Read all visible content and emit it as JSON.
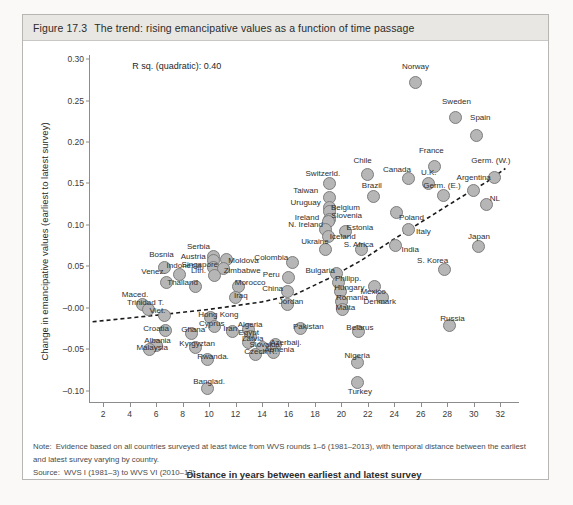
{
  "figure": {
    "number": "Figure 17.3",
    "caption": "The trend: rising emancipative values as a function of time passage"
  },
  "notes": {
    "note_lead": "Note:",
    "note_text": "Evidence based on all countries surveyed at least twice from WVS rounds 1–6 (1981–2013), with temporal distance between the earliest and latest survey varying by country.",
    "source_lead": "Source:",
    "source_text": "WVS I (1981–3) to WVS VI (2010–13)."
  },
  "annotation": {
    "r_squared": "R sq. (quadratic): 0.40"
  },
  "colors": {
    "marker_fill": "#b6b6b6",
    "marker_stroke": "#7d7d7d",
    "trend_line": "#1a1a1a",
    "axis": "#8c8c8c",
    "caption_bg": "#e8e7e4",
    "panel_bg": "#ffffff"
  },
  "chart_data": {
    "type": "scatter",
    "title": "The trend: rising emancipative values as a function of time passage",
    "xlabel": "Distance in years between earliest and latest survey",
    "ylabel": "Change in emancipative values (earliest to latest survey)",
    "xlim": [
      1,
      33.5
    ],
    "ylim": [
      -0.115,
      0.305
    ],
    "xticks": [
      2,
      4,
      6,
      8,
      10,
      12,
      14,
      16,
      18,
      20,
      22,
      24,
      26,
      28,
      30,
      32
    ],
    "ytick_labels": [
      "0.30",
      "0.25",
      "0.20",
      "0.15",
      "0.10",
      "0.05",
      "–0.00",
      "–0.05",
      "–0.10"
    ],
    "yticks": [
      0.3,
      0.25,
      0.2,
      0.15,
      0.1,
      0.05,
      0.0,
      -0.05,
      -0.1
    ],
    "grid": false,
    "legend": "none",
    "r_squared_quadratic": 0.4,
    "trend_type": "quadratic (dashed)",
    "trend_points": [
      {
        "x": 1.2,
        "y": -0.017
      },
      {
        "x": 6.0,
        "y": -0.009
      },
      {
        "x": 10.0,
        "y": -0.002
      },
      {
        "x": 14.0,
        "y": 0.007
      },
      {
        "x": 16.5,
        "y": 0.016
      },
      {
        "x": 19.0,
        "y": 0.035
      },
      {
        "x": 21.5,
        "y": 0.057
      },
      {
        "x": 24.0,
        "y": 0.083
      },
      {
        "x": 26.5,
        "y": 0.108
      },
      {
        "x": 29.0,
        "y": 0.133
      },
      {
        "x": 31.0,
        "y": 0.152
      },
      {
        "x": 32.4,
        "y": 0.168
      }
    ],
    "points": [
      {
        "label": "Norway",
        "x": 25.6,
        "y": 0.272,
        "lx": 25.6,
        "ly": 0.292
      },
      {
        "label": "Sweden",
        "x": 28.6,
        "y": 0.229,
        "lx": 28.7,
        "ly": 0.25
      },
      {
        "label": "Spain",
        "x": 30.2,
        "y": 0.208,
        "lx": 30.5,
        "ly": 0.23
      },
      {
        "label": "France",
        "x": 27.0,
        "y": 0.17,
        "lx": 26.8,
        "ly": 0.19
      },
      {
        "label": "Germ. (W.)",
        "x": 31.6,
        "y": 0.157,
        "lx": 31.3,
        "ly": 0.178
      },
      {
        "label": "Canada",
        "x": 25.1,
        "y": 0.156,
        "lx": 24.2,
        "ly": 0.168
      },
      {
        "label": "U.K.",
        "x": 26.6,
        "y": 0.15,
        "lx": 26.6,
        "ly": 0.164
      },
      {
        "label": "Argentina",
        "x": 30.0,
        "y": 0.141,
        "lx": 30.0,
        "ly": 0.158
      },
      {
        "label": "Germ. (E.)",
        "x": 27.7,
        "y": 0.135,
        "lx": 27.6,
        "ly": 0.148
      },
      {
        "label": "NL",
        "x": 31.0,
        "y": 0.124,
        "lx": 31.6,
        "ly": 0.132
      },
      {
        "label": "Chile",
        "x": 22.0,
        "y": 0.161,
        "lx": 21.6,
        "ly": 0.178
      },
      {
        "label": "Switzerld.",
        "x": 19.1,
        "y": 0.15,
        "lx": 18.6,
        "ly": 0.163
      },
      {
        "label": "Taiwan",
        "x": 19.1,
        "y": 0.133,
        "lx": 17.3,
        "ly": 0.142
      },
      {
        "label": "Brazil",
        "x": 22.4,
        "y": 0.134,
        "lx": 22.3,
        "ly": 0.148
      },
      {
        "label": "Uruguay",
        "x": 19.1,
        "y": 0.121,
        "lx": 17.3,
        "ly": 0.127
      },
      {
        "label": "Belgium",
        "x": 19.1,
        "y": 0.116,
        "lx": 20.3,
        "ly": 0.122
      },
      {
        "label": "Slovenia",
        "x": 19.1,
        "y": 0.107,
        "lx": 20.4,
        "ly": 0.112
      },
      {
        "label": "Ireland",
        "x": 19.0,
        "y": 0.104,
        "lx": 17.4,
        "ly": 0.11
      },
      {
        "label": "Poland",
        "x": 24.2,
        "y": 0.115,
        "lx": 25.3,
        "ly": 0.11
      },
      {
        "label": "N. Ireland",
        "x": 18.8,
        "y": 0.095,
        "lx": 17.3,
        "ly": 0.101
      },
      {
        "label": "Estonia",
        "x": 20.3,
        "y": 0.092,
        "lx": 21.4,
        "ly": 0.098
      },
      {
        "label": "Italy",
        "x": 25.1,
        "y": 0.095,
        "lx": 26.2,
        "ly": 0.092
      },
      {
        "label": "Iceland",
        "x": 19.0,
        "y": 0.086,
        "lx": 20.1,
        "ly": 0.086
      },
      {
        "label": "Japan",
        "x": 30.4,
        "y": 0.074,
        "lx": 30.4,
        "ly": 0.087
      },
      {
        "label": "S. Africa",
        "x": 21.5,
        "y": 0.07,
        "lx": 21.3,
        "ly": 0.077
      },
      {
        "label": "India",
        "x": 24.1,
        "y": 0.075,
        "lx": 25.2,
        "ly": 0.071
      },
      {
        "label": "Ukraine",
        "x": 18.8,
        "y": 0.07,
        "lx": 18.0,
        "ly": 0.08
      },
      {
        "label": "Serbia",
        "x": 10.3,
        "y": 0.062,
        "lx": 9.2,
        "ly": 0.074
      },
      {
        "label": "Bosnia",
        "x": 6.6,
        "y": 0.048,
        "lx": 6.4,
        "ly": 0.065
      },
      {
        "label": "Austria",
        "x": 10.3,
        "y": 0.057,
        "lx": 8.8,
        "ly": 0.062
      },
      {
        "label": "Moldova",
        "x": 11.3,
        "y": 0.058,
        "lx": 12.6,
        "ly": 0.057
      },
      {
        "label": "Singapore",
        "x": 10.3,
        "y": 0.048,
        "lx": 9.3,
        "ly": 0.053
      },
      {
        "label": "Indonesia",
        "x": 7.8,
        "y": 0.04,
        "lx": 8.1,
        "ly": 0.051
      },
      {
        "label": "Zimbabwe",
        "x": 11.1,
        "y": 0.047,
        "lx": 12.5,
        "ly": 0.046
      },
      {
        "label": "Lith.",
        "x": 10.4,
        "y": 0.039,
        "lx": 9.2,
        "ly": 0.045
      },
      {
        "label": "Colombia",
        "x": 16.3,
        "y": 0.054,
        "lx": 14.7,
        "ly": 0.061
      },
      {
        "label": "Venez.",
        "x": 6.8,
        "y": 0.031,
        "lx": 5.8,
        "ly": 0.044
      },
      {
        "label": "S. Korea",
        "x": 27.8,
        "y": 0.046,
        "lx": 26.9,
        "ly": 0.058
      },
      {
        "label": "Bulgaria",
        "x": 19.6,
        "y": 0.041,
        "lx": 18.4,
        "ly": 0.046
      },
      {
        "label": "Peru",
        "x": 16.0,
        "y": 0.036,
        "lx": 14.7,
        "ly": 0.041
      },
      {
        "label": "Thailand",
        "x": 9.0,
        "y": 0.026,
        "lx": 8.0,
        "ly": 0.031
      },
      {
        "label": "Morocco",
        "x": 12.2,
        "y": 0.026,
        "lx": 13.1,
        "ly": 0.031
      },
      {
        "label": "Philipp.",
        "x": 19.8,
        "y": 0.03,
        "lx": 20.5,
        "ly": 0.036
      },
      {
        "label": "Mexico",
        "x": 22.5,
        "y": 0.026,
        "lx": 22.4,
        "ly": 0.02
      },
      {
        "label": "Hungary",
        "x": 19.9,
        "y": 0.019,
        "lx": 20.6,
        "ly": 0.025
      },
      {
        "label": "Maced.",
        "x": 5.0,
        "y": 0.004,
        "lx": 4.4,
        "ly": 0.017
      },
      {
        "label": "China",
        "x": 15.9,
        "y": 0.019,
        "lx": 14.8,
        "ly": 0.024
      },
      {
        "label": "Iraq",
        "x": 12.0,
        "y": 0.012,
        "lx": 12.4,
        "ly": 0.015
      },
      {
        "label": "Trinidad T.",
        "x": 5.4,
        "y": -0.002,
        "lx": 5.2,
        "ly": 0.007
      },
      {
        "label": "Romania",
        "x": 20.0,
        "y": 0.008,
        "lx": 20.8,
        "ly": 0.013
      },
      {
        "label": "Denmark",
        "x": 23.1,
        "y": 0.012,
        "lx": 22.9,
        "ly": 0.008
      },
      {
        "label": "Jordan",
        "x": 15.9,
        "y": 0.004,
        "lx": 16.2,
        "ly": 0.008
      },
      {
        "label": "Viet.",
        "x": 6.6,
        "y": -0.009,
        "lx": 6.1,
        "ly": -0.003
      },
      {
        "label": "Hong Kong",
        "x": 10.1,
        "y": -0.012,
        "lx": 10.7,
        "ly": -0.008
      },
      {
        "label": "Malta",
        "x": 20.1,
        "y": -0.002,
        "lx": 20.3,
        "ly": 0.001
      },
      {
        "label": "Cyprus",
        "x": 10.4,
        "y": -0.023,
        "lx": 10.2,
        "ly": -0.018
      },
      {
        "label": "Algeria",
        "x": 13.0,
        "y": -0.026,
        "lx": 13.1,
        "ly": -0.02
      },
      {
        "label": "Croatia",
        "x": 6.7,
        "y": -0.028,
        "lx": 6.0,
        "ly": -0.025
      },
      {
        "label": "Ghana",
        "x": 8.7,
        "y": -0.031,
        "lx": 8.8,
        "ly": -0.026
      },
      {
        "label": "Iran",
        "x": 11.8,
        "y": -0.029,
        "lx": 11.6,
        "ly": -0.025
      },
      {
        "label": "Egypt",
        "x": 13.1,
        "y": -0.035,
        "lx": 13.0,
        "ly": -0.029
      },
      {
        "label": "Pakistan",
        "x": 16.9,
        "y": -0.025,
        "lx": 17.5,
        "ly": -0.022
      },
      {
        "label": "Belarus",
        "x": 21.3,
        "y": -0.029,
        "lx": 21.4,
        "ly": -0.023
      },
      {
        "label": "Russia",
        "x": 28.2,
        "y": -0.022,
        "lx": 28.4,
        "ly": -0.013
      },
      {
        "label": "Albania",
        "x": 6.0,
        "y": -0.045,
        "lx": 6.1,
        "ly": -0.039
      },
      {
        "label": "Latvia",
        "x": 13.0,
        "y": -0.042,
        "lx": 13.3,
        "ly": -0.037
      },
      {
        "label": "Kyrgyztan",
        "x": 9.0,
        "y": -0.048,
        "lx": 9.1,
        "ly": -0.042
      },
      {
        "label": "Malaysia",
        "x": 5.5,
        "y": -0.05,
        "lx": 5.7,
        "ly": -0.048
      },
      {
        "label": "Slovakia",
        "x": 14.0,
        "y": -0.048,
        "lx": 14.2,
        "ly": -0.044
      },
      {
        "label": "Azerbaij.",
        "x": 15.0,
        "y": -0.044,
        "lx": 15.8,
        "ly": -0.041
      },
      {
        "label": "Czech R.",
        "x": 13.5,
        "y": -0.056,
        "lx": 13.9,
        "ly": -0.052
      },
      {
        "label": "Armenia",
        "x": 14.9,
        "y": -0.054,
        "lx": 15.3,
        "ly": -0.05
      },
      {
        "label": "Rwanda.",
        "x": 9.9,
        "y": -0.062,
        "lx": 10.3,
        "ly": -0.058
      },
      {
        "label": "Nigeria",
        "x": 21.2,
        "y": -0.066,
        "lx": 21.2,
        "ly": -0.057
      },
      {
        "label": "Banglad.",
        "x": 9.9,
        "y": -0.098,
        "lx": 10.0,
        "ly": -0.088
      },
      {
        "label": "Turkey",
        "x": 21.2,
        "y": -0.09,
        "lx": 21.4,
        "ly": -0.1
      }
    ]
  }
}
